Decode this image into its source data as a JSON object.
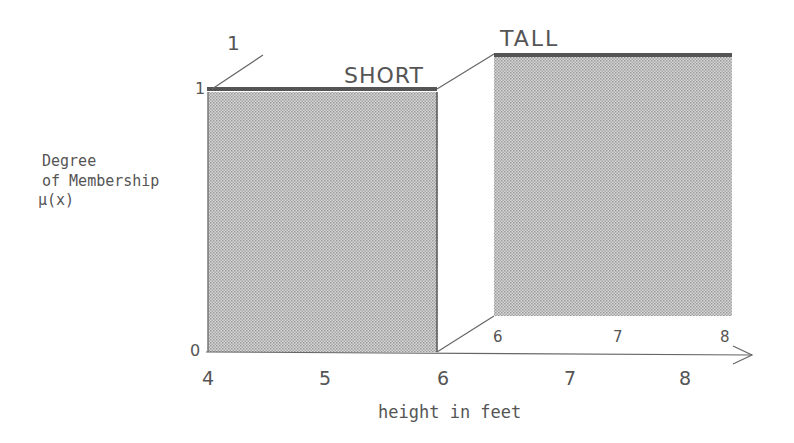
{
  "diagram": {
    "type": "fuzzy-set-membership (crisp sets)",
    "y_axis_label": [
      "Degree",
      "of Membership",
      "μ(x)"
    ],
    "y_ticks": {
      "zero": "0",
      "one": "1"
    },
    "depth_one_label": "1",
    "x_axis_label": "height in feet",
    "front_x_ticks": [
      "4",
      "5",
      "6",
      "7",
      "8"
    ],
    "back_x_ticks": [
      "6",
      "7",
      "8"
    ],
    "sets": [
      {
        "name": "SHORT",
        "range": [
          4,
          6
        ],
        "membership": 1
      },
      {
        "name": "TALL",
        "range": [
          6,
          8
        ],
        "membership": 1
      }
    ],
    "colors": {
      "fill": "#c8c8c8",
      "top_edge": "#555555",
      "line": "#666666",
      "text": "#555555"
    }
  }
}
